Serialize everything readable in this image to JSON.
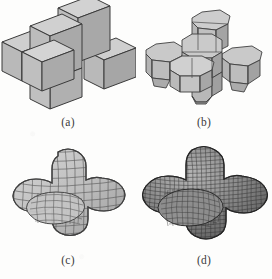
{
  "figure": {
    "background_color": "#fdfdfc",
    "panels": [
      {
        "id": "a",
        "caption": "(a)",
        "description": "control mesh: six axis-aligned cubes forming a 3D cross (plus) solid, flat-shaded",
        "stage": "control cage",
        "face_fill": "#b9b9b9",
        "face_fill_light": "#cfcfcf",
        "face_fill_dark": "#a3a3a3",
        "edge_color": "#3a3a3a",
        "mesh_resolution": 1
      },
      {
        "id": "b",
        "caption": "(b)",
        "description": "first subdivision step: corners and edges chamfered, quad faces visible",
        "stage": "subdivision level 1",
        "face_fill": "#bcbcbc",
        "face_fill_light": "#d2d2d2",
        "face_fill_dark": "#a6a6a6",
        "edge_color": "#3f3f3f",
        "mesh_resolution": 3
      },
      {
        "id": "c",
        "caption": "(c)",
        "description": "further subdivision: rounded cross with dense visible quad wireframe",
        "stage": "subdivision level 3",
        "face_fill": "#bdbdbd",
        "face_fill_light": "#d4d4d4",
        "face_fill_dark": "#a5a5a5",
        "edge_color": "#4a4a4a",
        "mesh_resolution": 8
      },
      {
        "id": "d",
        "caption": "(d)",
        "description": "limit surface: smooth rounded cross, very dense dark wireframe",
        "stage": "limit surface",
        "face_fill": "#8f8f8f",
        "face_fill_light": "#ababab",
        "face_fill_dark": "#6e6e6e",
        "edge_color": "#2b2b2b",
        "mesh_resolution": 18
      }
    ]
  }
}
